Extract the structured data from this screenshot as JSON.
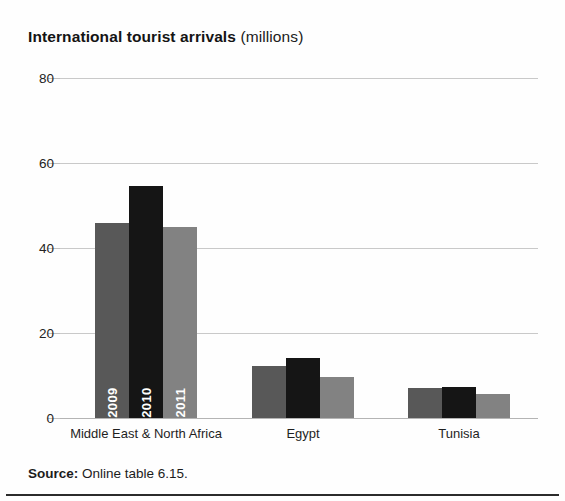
{
  "title": {
    "main": "International tourist arrivals",
    "sub": "(millions)"
  },
  "source": {
    "label": "Source:",
    "text": "Online table 6.15."
  },
  "axis": {
    "ticks": [
      "0",
      "20",
      "40",
      "60",
      "80"
    ]
  },
  "series_labels": [
    "2009",
    "2010",
    "2011"
  ],
  "chart_data": {
    "type": "bar",
    "title": "International tourist arrivals (millions)",
    "xlabel": "",
    "ylabel": "",
    "ylim": [
      0,
      80
    ],
    "yticks": [
      0,
      20,
      40,
      60,
      80
    ],
    "grid": true,
    "legend": "in-bar vertical labels",
    "categories": [
      "Middle East & North Africa",
      "Egypt",
      "Tunisia"
    ],
    "series": [
      {
        "name": "2009",
        "color": "#585858",
        "values": [
          46,
          12.3,
          7.0
        ]
      },
      {
        "name": "2010",
        "color": "#151515",
        "values": [
          54.5,
          14.2,
          7.3
        ]
      },
      {
        "name": "2011",
        "color": "#828282",
        "values": [
          45,
          9.7,
          5.6
        ]
      }
    ]
  },
  "colors": {
    "year_2009": "#585858",
    "year_2010": "#151515",
    "year_2011": "#828282",
    "gridline": "#c9c9c9",
    "rule": "#2b2b2b"
  }
}
